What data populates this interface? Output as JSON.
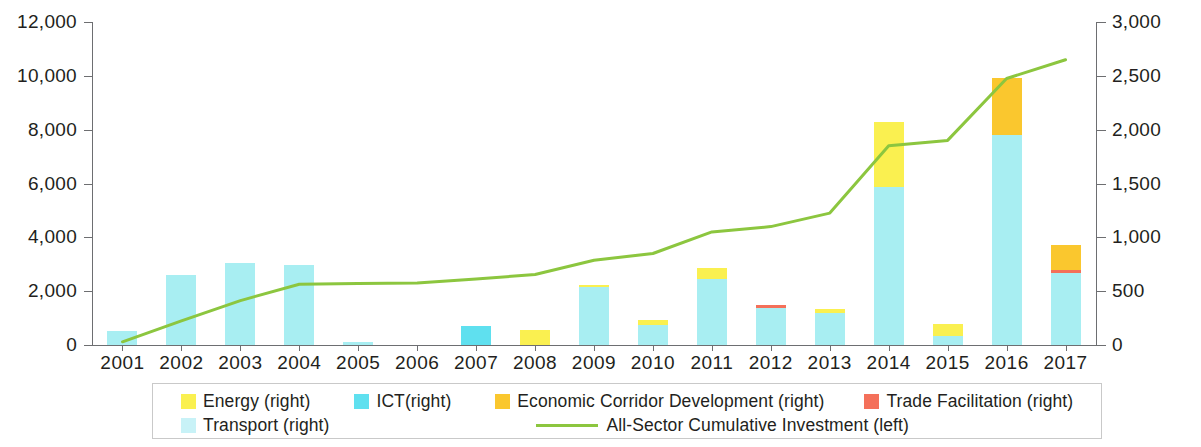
{
  "chart_data": {
    "type": "bar",
    "title": "",
    "xlabel": "",
    "ylabel": "",
    "grid": false,
    "legend_position": "bottom",
    "categories": [
      "2001",
      "2002",
      "2003",
      "2004",
      "2005",
      "2006",
      "2007",
      "2008",
      "2009",
      "2010",
      "2011",
      "2012",
      "2013",
      "2014",
      "2015",
      "2016",
      "2017"
    ],
    "left_axis": {
      "label": "All-Sector Cumulative Investment (left)",
      "ylim": [
        0,
        12000
      ],
      "ticks": [
        0,
        2000,
        4000,
        6000,
        8000,
        10000,
        12000
      ],
      "tick_labels": [
        "0",
        "2,000",
        "4,000",
        "6,000",
        "8,000",
        "10,000",
        "12,000"
      ]
    },
    "right_axis": {
      "label": "Annual investment by sector (right)",
      "ylim": [
        0,
        3000
      ],
      "ticks": [
        0,
        500,
        1000,
        1500,
        2000,
        2500,
        3000
      ],
      "tick_labels": [
        "0",
        "500",
        "1,000",
        "1,500",
        "2,000",
        "2,500",
        "3,000"
      ]
    },
    "stacked_bar_series": [
      {
        "name": "Transport (right)",
        "color": "#a8eef2",
        "axis": "right",
        "values": [
          130,
          650,
          760,
          740,
          30,
          0,
          0,
          0,
          540,
          190,
          610,
          340,
          300,
          1470,
          80,
          1950,
          670
        ]
      },
      {
        "name": "ICT(right)",
        "color": "#5fe0ef",
        "axis": "right",
        "values": [
          0,
          0,
          0,
          0,
          0,
          0,
          175,
          0,
          0,
          0,
          0,
          0,
          0,
          0,
          0,
          0,
          0
        ]
      },
      {
        "name": "Energy (right)",
        "color": "#faf050",
        "axis": "right",
        "values": [
          0,
          0,
          0,
          0,
          0,
          0,
          0,
          135,
          20,
          45,
          110,
          0,
          35,
          600,
          115,
          0,
          0
        ]
      },
      {
        "name": "Trade Facilitation (right)",
        "color": "#f4705a",
        "axis": "right",
        "values": [
          0,
          0,
          0,
          0,
          0,
          0,
          0,
          0,
          0,
          0,
          0,
          30,
          0,
          0,
          0,
          0,
          30
        ]
      },
      {
        "name": "Economic Corridor Development (right)",
        "color": "#fac72e",
        "axis": "right",
        "values": [
          0,
          0,
          0,
          0,
          0,
          0,
          0,
          0,
          0,
          0,
          0,
          0,
          0,
          0,
          0,
          530,
          230
        ]
      }
    ],
    "line_series": {
      "name": "All-Sector Cumulative Investment (left)",
      "color": "#8cc63f",
      "axis": "left",
      "values": [
        120,
        900,
        1650,
        2260,
        2290,
        2300,
        2450,
        2620,
        3150,
        3400,
        4200,
        4400,
        4900,
        7400,
        7600,
        9900,
        10600
      ]
    }
  },
  "legend": {
    "row1": [
      {
        "label": "Energy (right)",
        "color": "#faf050",
        "marker": "square"
      },
      {
        "label": "ICT(right)",
        "color": "#5fe0ef",
        "marker": "square"
      },
      {
        "label": "Economic Corridor Development (right)",
        "color": "#fac72e",
        "marker": "square"
      },
      {
        "label": "Trade Facilitation (right)",
        "color": "#f4705a",
        "marker": "square"
      }
    ],
    "row2": [
      {
        "label": "Transport (right)",
        "color": "#c8f2f7",
        "marker": "square"
      },
      {
        "label": "All-Sector Cumulative Investment (left)",
        "color": "#8cc63f",
        "marker": "line"
      }
    ]
  }
}
